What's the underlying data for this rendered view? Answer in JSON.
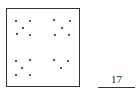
{
  "puzzle": {
    "quadrants": [
      {
        "name": "top-left",
        "dot_count": 5,
        "dots": [
          [
            16,
            21
          ],
          [
            30,
            21
          ],
          [
            23,
            28
          ],
          [
            17,
            34
          ],
          [
            30,
            35
          ]
        ]
      },
      {
        "name": "top-right",
        "dot_count": 5,
        "dots": [
          [
            54,
            20
          ],
          [
            70,
            21
          ],
          [
            62,
            28
          ],
          [
            55,
            35
          ],
          [
            69,
            35
          ]
        ]
      },
      {
        "name": "bottom-left",
        "dot_count": 5,
        "dots": [
          [
            16,
            61
          ],
          [
            30,
            60
          ],
          [
            22,
            68
          ],
          [
            16,
            75
          ],
          [
            30,
            75
          ]
        ]
      },
      {
        "name": "bottom-right",
        "dot_count": 3,
        "dots": [
          [
            54,
            60
          ],
          [
            68,
            61
          ],
          [
            61,
            68
          ]
        ]
      }
    ],
    "answer": "17"
  }
}
